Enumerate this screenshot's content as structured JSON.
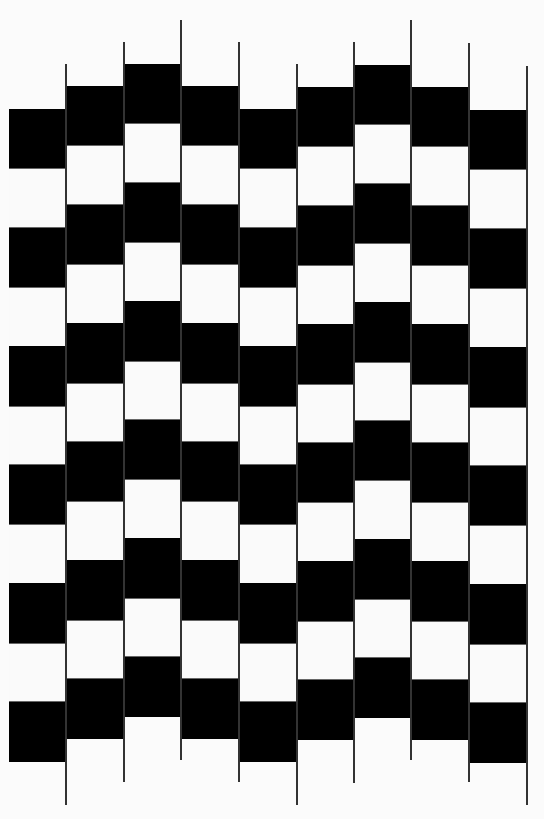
{
  "illusion": {
    "type": "cafe-wall-zigzag",
    "colors": {
      "dark": "#000000",
      "light": "#fafafa",
      "line": "#333333",
      "background": "#fbfbfb"
    },
    "grid": {
      "left": 9,
      "column_width": 57.5,
      "cell_height": 59.3,
      "cells_per_column": 11,
      "first_cell": "black",
      "column_tops": [
        109,
        86,
        64,
        86,
        109,
        87,
        65,
        87,
        110
      ]
    },
    "lines": [
      {
        "x": 66,
        "top": 64,
        "bottom": 805
      },
      {
        "x": 124,
        "top": 42,
        "bottom": 782
      },
      {
        "x": 181,
        "top": 20,
        "bottom": 760
      },
      {
        "x": 239,
        "top": 42,
        "bottom": 782
      },
      {
        "x": 297,
        "top": 64,
        "bottom": 805
      },
      {
        "x": 354,
        "top": 42,
        "bottom": 783
      },
      {
        "x": 411,
        "top": 20,
        "bottom": 760
      },
      {
        "x": 469,
        "top": 43,
        "bottom": 782
      },
      {
        "x": 527,
        "top": 66,
        "bottom": 805
      }
    ]
  }
}
